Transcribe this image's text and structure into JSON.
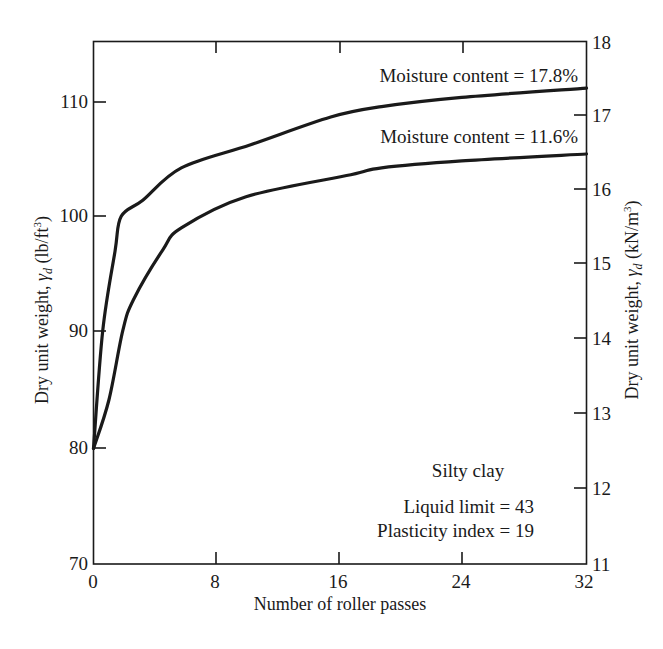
{
  "chart_data": {
    "type": "line",
    "title": "",
    "xlabel": "Number of roller passes",
    "ylabel": "Dry unit weight, γd (lb/ft³)",
    "ylabel_right": "Dry unit weight, γd (kN/m³)",
    "xlim": [
      0,
      32
    ],
    "ylim": [
      70,
      115
    ],
    "ylim_right": [
      11,
      18
    ],
    "x_ticks": [
      0,
      8,
      16,
      24,
      32
    ],
    "y_ticks": [
      70,
      80,
      90,
      100,
      110
    ],
    "y_ticks_right": [
      11,
      12,
      13,
      14,
      15,
      16,
      17,
      18
    ],
    "grid": false,
    "legend": "inline labels",
    "series": [
      {
        "name": "Moisture content = 17.8%",
        "x": [
          0,
          0.6,
          1.4,
          1.8,
          3.2,
          5.7,
          10.2,
          15.4,
          18.7,
          23.9,
          32
        ],
        "values": [
          80,
          90.2,
          97.1,
          100.1,
          101.5,
          104.3,
          106.3,
          108.7,
          109.6,
          110.4,
          111.2
        ]
      },
      {
        "name": "Moisture content = 11.6%",
        "x": [
          0,
          1.0,
          1.9,
          2.6,
          4.5,
          5.7,
          9.9,
          16.7,
          18.7,
          23.9,
          32
        ],
        "values": [
          80,
          84.2,
          90.2,
          92.9,
          97.2,
          99.1,
          101.8,
          103.7,
          104.3,
          104.9,
          105.5
        ]
      }
    ],
    "annotations": {
      "soil_type": "Silty clay",
      "liquid_limit": "Liquid limit = 43",
      "plasticity_index": "Plasticity index = 19"
    }
  },
  "labels": {
    "x_axis_title": "Number of roller passes",
    "y_axis_left_prefix": "Dry unit weight, ",
    "y_axis_left_symbol": "γ",
    "y_axis_left_sub": "d",
    "y_axis_left_units": " (lb/ft",
    "y_axis_left_sup": "3",
    "y_axis_left_close": ")",
    "y_axis_right_prefix": "Dry unit weight, ",
    "y_axis_right_symbol": "γ",
    "y_axis_right_sub": "d",
    "y_axis_right_units": " (kN/m",
    "y_axis_right_sup": "3",
    "y_axis_right_close": ")",
    "curve_label_high": "Moisture content = 17.8%",
    "curve_label_low": "Moisture content = 11.6%",
    "soil_type": "Silty clay",
    "liquid_limit": "Liquid limit = 43",
    "plasticity_index": "Plasticity index = 19",
    "x_ticks": [
      "0",
      "8",
      "16",
      "24",
      "32"
    ],
    "y_ticks_left": [
      "70",
      "80",
      "90",
      "100",
      "110"
    ],
    "y_ticks_right": [
      "11",
      "12",
      "13",
      "14",
      "15",
      "16",
      "17",
      "18"
    ]
  }
}
